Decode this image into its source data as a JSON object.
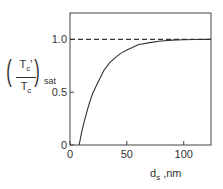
{
  "chart_data": {
    "type": "line",
    "title": "",
    "xlabel": "d_s ,nm",
    "ylabel": "(T_c' / T_c)_sat",
    "xlim": [
      0,
      124
    ],
    "ylim": [
      0,
      1.25
    ],
    "grid": false,
    "legend": null,
    "xticks": [
      0,
      50,
      100
    ],
    "xtick_labels": [
      "0",
      "50",
      "100"
    ],
    "yticks": [
      0,
      0.5,
      1.0
    ],
    "ytick_labels": [
      "0",
      "0.5",
      "1.0"
    ],
    "series": [
      {
        "name": "T_c'/T_c ratio",
        "style": "solid",
        "x": [
          8,
          9,
          10,
          12,
          14,
          16,
          18,
          20,
          25,
          30,
          35,
          40,
          45,
          50,
          60,
          70,
          80,
          90,
          100,
          110,
          124
        ],
        "y": [
          0.0,
          0.05,
          0.11,
          0.2,
          0.28,
          0.36,
          0.43,
          0.49,
          0.6,
          0.71,
          0.78,
          0.83,
          0.87,
          0.9,
          0.95,
          0.97,
          0.985,
          0.993,
          0.997,
          0.999,
          1.0
        ]
      },
      {
        "name": "saturation level",
        "style": "dashed",
        "x": [
          0,
          124
        ],
        "y": [
          1.0,
          1.0
        ]
      }
    ],
    "annotations": []
  },
  "labels": {
    "y_num": "T",
    "y_num_sub": "c",
    "y_num_prime": "'",
    "y_den": "T",
    "y_den_sub": "c",
    "y_outer_sub": "sat",
    "x_main": "d",
    "x_sub": "s",
    "x_unit": " ,nm"
  }
}
